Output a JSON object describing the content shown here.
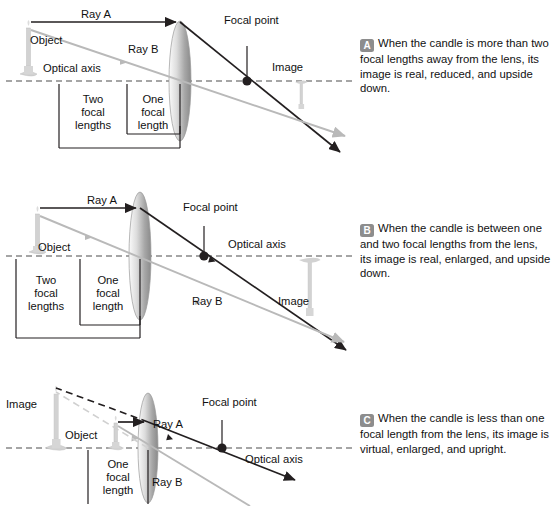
{
  "figure": {
    "colors": {
      "ray_a": "#231f20",
      "ray_b": "#b9b9b9",
      "axis": "#4d4d4d",
      "lens_light": "#f2f2f2",
      "lens_dark": "#8a8a8a",
      "candle": "#cfcfcf",
      "badge": "#8d8d8d",
      "text": "#111111"
    }
  },
  "panels": [
    {
      "letter": "A",
      "text": "When the candle is more than two focal lengths away from the lens, its image is real, reduced, and upside down."
    },
    {
      "letter": "B",
      "text": "When the candle is between one and two focal lengths from the lens, its image is real, enlarged, and upside down."
    },
    {
      "letter": "C",
      "text": "When the candle is less than one focal length from the lens, its image is virtual, enlarged, and upright."
    }
  ],
  "diagrams": [
    {
      "id": "A",
      "labels": {
        "object": "Object",
        "image": "Image",
        "ray_a": "Ray A",
        "ray_b": "Ray B",
        "optical_axis": "Optical axis",
        "focal_point": "Focal point",
        "two_focal_lengths_line1": "Two",
        "two_focal_lengths_line2": "focal",
        "two_focal_lengths_line3": "lengths",
        "one_focal_length_line1": "One",
        "one_focal_length_line2": "focal",
        "one_focal_length_line3": "length"
      }
    },
    {
      "id": "B",
      "labels": {
        "object": "Object",
        "image": "Image",
        "ray_a": "Ray A",
        "ray_b": "Ray B",
        "optical_axis": "Optical axis",
        "focal_point": "Focal point",
        "two_focal_lengths_line1": "Two",
        "two_focal_lengths_line2": "focal",
        "two_focal_lengths_line3": "lengths",
        "one_focal_length_line1": "One",
        "one_focal_length_line2": "focal",
        "one_focal_length_line3": "length"
      }
    },
    {
      "id": "C",
      "labels": {
        "object": "Object",
        "image": "Image",
        "ray_a": "Ray A",
        "ray_b": "Ray B",
        "optical_axis": "Optical axis",
        "focal_point": "Focal point",
        "one_focal_length_line1": "One",
        "one_focal_length_line2": "focal",
        "one_focal_length_line3": "length"
      }
    }
  ]
}
